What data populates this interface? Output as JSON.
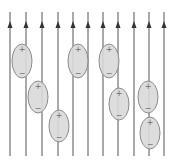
{
  "diagram": {
    "canvas": {
      "width": 174,
      "height": 160
    },
    "colors": {
      "background": "#ffffff",
      "field_line": "#555555",
      "arrow_head": "#333333",
      "molecule_fill": "#d9d9d9",
      "molecule_stroke": "#8c8c8c",
      "sign": "#6e6e6e"
    },
    "field_lines": {
      "direction": "up",
      "y_top": 12,
      "y_bottom": 156,
      "arrow_y": 26,
      "x_positions": [
        10,
        26,
        42,
        58,
        73,
        88,
        103,
        118,
        134,
        149,
        164
      ]
    },
    "molecules": [
      {
        "cx": 22,
        "cy": 61,
        "rx": 10,
        "ry": 17,
        "top_sign": "+",
        "bottom_sign": "−"
      },
      {
        "cx": 78,
        "cy": 61,
        "rx": 10,
        "ry": 17,
        "top_sign": "+",
        "bottom_sign": "−"
      },
      {
        "cx": 109,
        "cy": 61,
        "rx": 10,
        "ry": 17,
        "top_sign": "+",
        "bottom_sign": "−"
      },
      {
        "cx": 38,
        "cy": 97,
        "rx": 10,
        "ry": 16,
        "top_sign": "+",
        "bottom_sign": "−"
      },
      {
        "cx": 148,
        "cy": 97,
        "rx": 10,
        "ry": 16,
        "top_sign": "+",
        "bottom_sign": "−"
      },
      {
        "cx": 119,
        "cy": 104,
        "rx": 10,
        "ry": 16,
        "top_sign": "+",
        "bottom_sign": "−"
      },
      {
        "cx": 59,
        "cy": 126,
        "rx": 10,
        "ry": 16,
        "top_sign": "+",
        "bottom_sign": "−"
      },
      {
        "cx": 150,
        "cy": 133,
        "rx": 10,
        "ry": 16,
        "top_sign": "+",
        "bottom_sign": "−"
      }
    ]
  }
}
